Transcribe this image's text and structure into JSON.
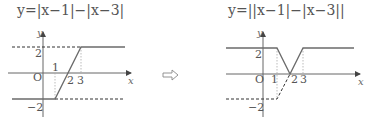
{
  "left_graph": {
    "equation": "y=|x−1|−|x−3|",
    "axis_labels": {
      "x": "x",
      "y": "y",
      "origin": "O"
    },
    "tick_labels": {
      "x1": "1",
      "x2": "2",
      "x3": "3",
      "y_pos": "2",
      "y_neg": "−2"
    }
  },
  "arrow": {
    "symbol": "⇨",
    "meaning": "transforms-to"
  },
  "right_graph": {
    "equation": "y=||x−1|−|x−3||",
    "axis_labels": {
      "x": "x",
      "y": "y",
      "origin": "O"
    },
    "tick_labels": {
      "x1": "1",
      "x2": "2",
      "x3": "3",
      "y_pos": "2",
      "y_neg": "−2"
    }
  },
  "colors": {
    "curve": "#6b6b6b",
    "axis": "#555555",
    "dashed": "#333333",
    "guide": "#aaaaaa"
  }
}
